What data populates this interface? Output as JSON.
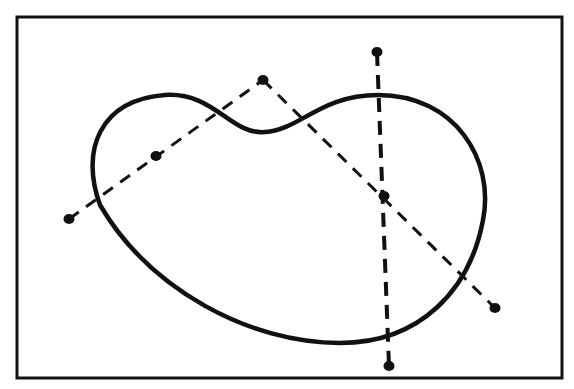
{
  "diagram": {
    "colors": {
      "stroke": "#111111",
      "background": "#ffffff"
    },
    "frame": {
      "x": 17,
      "y": 17,
      "width": 545,
      "height": 361
    },
    "curve_path": "M 100 205 C 80 150, 100 100, 165 95 C 215 92, 230 135, 265 132 C 300 130, 320 95, 378 95 C 455 95, 495 160, 483 220 C 470 290, 420 343, 340 343 C 250 343, 150 290, 100 205 Z",
    "segments": [
      {
        "name": "segment-left-to-apex",
        "style": "dashed",
        "x1": 69,
        "y1": 219,
        "x2": 263,
        "y2": 80
      },
      {
        "name": "segment-apex-to-right",
        "style": "dashed",
        "x1": 263,
        "y1": 80,
        "x2": 495,
        "y2": 308
      },
      {
        "name": "segment-vertical",
        "style": "dash-dot",
        "x1": 377,
        "y1": 52,
        "x2": 389,
        "y2": 366
      }
    ],
    "points": [
      {
        "name": "point-left",
        "x": 69,
        "y": 219
      },
      {
        "name": "point-inner-left",
        "x": 156,
        "y": 156
      },
      {
        "name": "point-apex",
        "x": 263,
        "y": 80
      },
      {
        "name": "point-top",
        "x": 377,
        "y": 52
      },
      {
        "name": "point-intersection",
        "x": 384,
        "y": 196
      },
      {
        "name": "point-right",
        "x": 495,
        "y": 308
      },
      {
        "name": "point-bottom",
        "x": 389,
        "y": 366
      }
    ]
  }
}
